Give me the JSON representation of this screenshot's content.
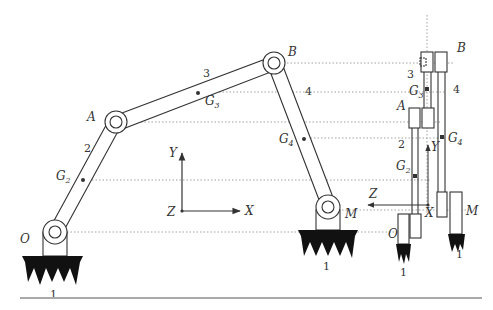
{
  "figure": {
    "type": "four-bar linkage mechanism diagram",
    "views": [
      "front view (X-Y plane)",
      "side view (Z-Y plane)"
    ]
  },
  "front_view": {
    "joints": {
      "O": "O",
      "A": "A",
      "B": "B",
      "M": "M"
    },
    "links": {
      "ground": "1",
      "crank": "2",
      "coupler": "3",
      "rocker": "4"
    },
    "centers_of_mass": {
      "g2": "G",
      "g2_sub": "2",
      "g3": "G",
      "g3_sub": "3",
      "g4": "G",
      "g4_sub": "4"
    },
    "ground_labels": [
      "1",
      "1"
    ],
    "axes": {
      "x": "X",
      "y": "Y",
      "z": "Z"
    }
  },
  "side_view": {
    "joints": {
      "O": "O",
      "A": "A",
      "B": "B",
      "M": "M"
    },
    "links": {
      "crank": "2",
      "coupler": "3",
      "rocker": "4"
    },
    "centers_of_mass": {
      "g2": "G",
      "g2_sub": "2",
      "g3": "G",
      "g3_sub": "3",
      "g4": "G",
      "g4_sub": "4"
    },
    "ground_labels": [
      "1",
      "1"
    ],
    "axes": {
      "x": "X",
      "y": "Y",
      "z": "Z"
    }
  },
  "colors": {
    "line": "#333333",
    "dotted": "#999999",
    "ground_fill": "#111111",
    "baseline": "#aaaaaa"
  }
}
